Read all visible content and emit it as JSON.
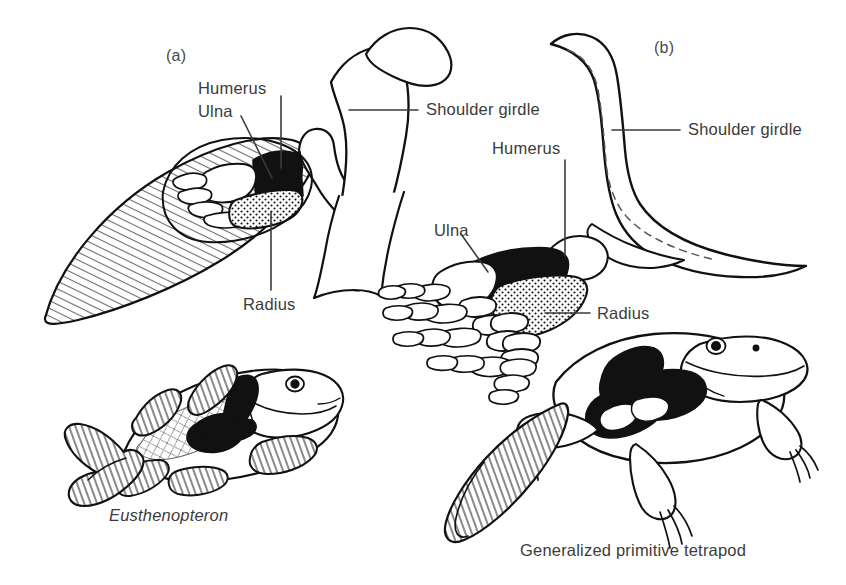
{
  "figure": {
    "background_color": "#ffffff",
    "ink_color": "#111111",
    "text_color": "#3b3b3b",
    "width": 846,
    "height": 585
  },
  "panels": [
    {
      "id": "a",
      "letter": "(a)",
      "letter_x": 166,
      "letter_y": 56,
      "subject": "Eusthenopteron pectoral fin and shoulder girdle"
    },
    {
      "id": "b",
      "letter": "(b)",
      "letter_x": 654,
      "letter_y": 47,
      "subject": "Generalized primitive tetrapod forelimb and shoulder girdle"
    }
  ],
  "labels": [
    {
      "id": "a-humerus",
      "text": "Humerus",
      "x": 198,
      "y": 88,
      "align": "left",
      "panel": "a",
      "bone": "humerus",
      "fill": "black"
    },
    {
      "id": "a-ulna",
      "text": "Ulna",
      "x": 198,
      "y": 110,
      "align": "left",
      "panel": "a",
      "bone": "ulna",
      "fill": "white"
    },
    {
      "id": "a-radius",
      "text": "Radius",
      "x": 243,
      "y": 303,
      "align": "left",
      "panel": "a",
      "bone": "radius",
      "fill": "stippled"
    },
    {
      "id": "a-shoulder-girdle",
      "text": "Shoulder girdle",
      "x": 426,
      "y": 96,
      "align": "left",
      "panel": "a",
      "bone": "shoulder girdle",
      "fill": "white"
    },
    {
      "id": "b-shoulder-girdle",
      "text": "Shoulder girdle",
      "x": 688,
      "y": 117,
      "align": "left",
      "panel": "b",
      "bone": "shoulder girdle",
      "fill": "white"
    },
    {
      "id": "b-humerus",
      "text": "Humerus",
      "x": 492,
      "y": 145,
      "align": "left",
      "panel": "b",
      "bone": "humerus",
      "fill": "black"
    },
    {
      "id": "b-ulna",
      "text": "Ulna",
      "x": 434,
      "y": 228,
      "align": "left",
      "panel": "b",
      "bone": "ulna",
      "fill": "white"
    },
    {
      "id": "b-radius",
      "text": "Radius",
      "x": 597,
      "y": 313,
      "align": "left",
      "panel": "b",
      "bone": "radius",
      "fill": "stippled"
    }
  ],
  "captions": [
    {
      "id": "caption-fish",
      "text": "Eusthenopteron",
      "style": "italic",
      "x": 109,
      "y": 516,
      "panel": "a"
    },
    {
      "id": "caption-tetrapod",
      "text": "Generalized primitive tetrapod",
      "style": "roman",
      "x": 520,
      "y": 550,
      "panel": "b"
    }
  ],
  "organisms": [
    {
      "id": "eusthenopteron",
      "common": "lobe-finned fish",
      "panel": "a",
      "highlighted_bones": [
        "shoulder girdle",
        "humerus",
        "ulna",
        "radius"
      ]
    },
    {
      "id": "primitive-tetrapod",
      "common": "salamander-like tetrapod",
      "panel": "b",
      "highlighted_bones": [
        "shoulder girdle",
        "humerus",
        "ulna",
        "radius"
      ]
    }
  ],
  "bone_key": {
    "humerus_fill": "solid black",
    "radius_fill": "stippled / dotted",
    "ulna_fill": "white outline",
    "girdle_fill": "white outline"
  }
}
